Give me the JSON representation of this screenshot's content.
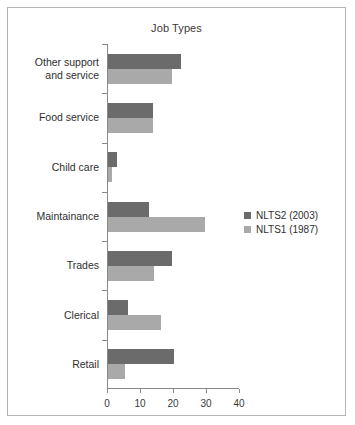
{
  "chart_data": {
    "type": "bar",
    "orientation": "horizontal",
    "title": "Job Types",
    "xlabel": "",
    "ylabel": "",
    "xlim": [
      0,
      40
    ],
    "xticks": [
      0,
      10,
      20,
      30,
      40
    ],
    "grid": false,
    "legend_position": "right",
    "categories": [
      "Other support\nand service",
      "Food service",
      "Child care",
      "Maintainance",
      "Trades",
      "Clerical",
      "Retail"
    ],
    "series": [
      {
        "name": "NLTS2 (2003)",
        "color": "#6b6b6b",
        "values": [
          22,
          13.5,
          2.8,
          12.5,
          19.5,
          6,
          20
        ]
      },
      {
        "name": "NLTS1 (1987)",
        "color": "#a9a9a9",
        "values": [
          19.5,
          13.5,
          1.2,
          29.5,
          14,
          16,
          5
        ]
      }
    ]
  }
}
